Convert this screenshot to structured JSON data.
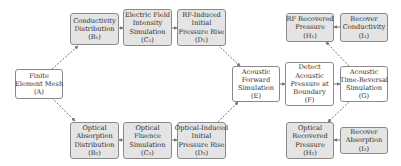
{
  "colors": {
    "shaded_fill": "#e4e4e4",
    "plain_fill": "#ffffff",
    "border": "#8a8a8a",
    "edge": "#777777",
    "text": "#2e2e2e"
  },
  "nodes": {
    "A": {
      "lines": [
        "Finite",
        "Element Mesh",
        "(A)"
      ]
    },
    "B1": {
      "lines": [
        "Conductivity",
        "Distribution",
        "(B₁)"
      ]
    },
    "C1": {
      "lines": [
        "Electric Field",
        "Intensity",
        "Simulation",
        "(C₁)"
      ]
    },
    "D1": {
      "lines": [
        "RF-Induced",
        "Initial",
        "Pressure Rise",
        "(D₁)"
      ]
    },
    "E": {
      "lines": [
        "Acoustic",
        "Forward",
        "Simulation",
        "(E)"
      ]
    },
    "F": {
      "lines": [
        "Detect",
        "Acoustic",
        "Pressure at",
        "Boundary",
        "(F)"
      ]
    },
    "G": {
      "lines": [
        "Acoustic",
        "Time-Reversal",
        "Simulation",
        "(G)"
      ]
    },
    "H1": {
      "lines": [
        "RF Recovered",
        "Pressure",
        "(H₁)"
      ]
    },
    "I1": {
      "lines": [
        "Recover",
        "Conductivity",
        "(I₁)"
      ]
    },
    "B2": {
      "lines": [
        "Optical",
        "Absorption",
        "Distribution",
        "(B₂)"
      ]
    },
    "C2": {
      "lines": [
        "Optical",
        "Fluence",
        "Simulation",
        "(C₂)"
      ]
    },
    "D2": {
      "lines": [
        "Optical-Induced",
        "Initial",
        "Pressure Rise",
        "(D₂)"
      ]
    },
    "H2": {
      "lines": [
        "Optical",
        "Recovered",
        "Pressure",
        "(H₂)"
      ]
    },
    "I2": {
      "lines": [
        "Recover",
        "Absorption",
        "(I₂)"
      ]
    }
  },
  "edges": [
    {
      "from": "A",
      "to": "B1",
      "style": "dashed"
    },
    {
      "from": "A",
      "to": "B2",
      "style": "dashed"
    },
    {
      "from": "B1",
      "to": "C1",
      "style": "solid"
    },
    {
      "from": "C1",
      "to": "D1",
      "style": "solid"
    },
    {
      "from": "B2",
      "to": "C2",
      "style": "solid"
    },
    {
      "from": "C2",
      "to": "D2",
      "style": "solid"
    },
    {
      "from": "D1",
      "to": "E",
      "style": "dashed"
    },
    {
      "from": "D2",
      "to": "E",
      "style": "dashed"
    },
    {
      "from": "E",
      "to": "F",
      "style": "solid"
    },
    {
      "from": "F",
      "to": "G",
      "style": "solid"
    },
    {
      "from": "G",
      "to": "H1",
      "style": "dashed"
    },
    {
      "from": "G",
      "to": "H2",
      "style": "dashed"
    },
    {
      "from": "H1",
      "to": "I1",
      "style": "solid"
    },
    {
      "from": "H2",
      "to": "I2",
      "style": "solid"
    }
  ]
}
